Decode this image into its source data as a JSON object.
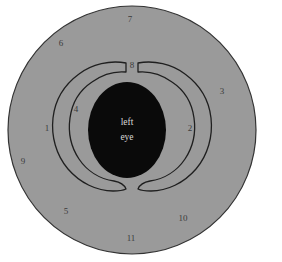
{
  "figure": {
    "kind": "anatomical-eye-cross-section-diagram",
    "center_label": {
      "line1": "left",
      "line2": "eye"
    },
    "colors": {
      "background": "#ffffff",
      "outer_disc_fill": "#9a9a9a",
      "outer_disc_stroke": "#333333",
      "band_fill": "#9a9a9a",
      "band_stroke": "#1f1f1f",
      "pupil_fill": "#0a0a0a",
      "label_text": "#3a3a3a",
      "center_text": "#d8d8d8"
    },
    "geometry": {
      "outer_disc": {
        "cx": 132,
        "cy": 130,
        "r": 124
      },
      "pupil": {
        "cx": 127,
        "cy": 130,
        "rx": 39,
        "ry": 48
      }
    },
    "labels": [
      {
        "id": "1",
        "text": "1",
        "x": 47,
        "y": 129
      },
      {
        "id": "2",
        "text": "2",
        "x": 190,
        "y": 129
      },
      {
        "id": "3",
        "text": "3",
        "x": 222,
        "y": 92
      },
      {
        "id": "4",
        "text": "4",
        "x": 76,
        "y": 110
      },
      {
        "id": "5",
        "text": "5",
        "x": 66,
        "y": 212
      },
      {
        "id": "6",
        "text": "6",
        "x": 61,
        "y": 44
      },
      {
        "id": "7",
        "text": "7",
        "x": 130,
        "y": 20
      },
      {
        "id": "8",
        "text": "8",
        "x": 132,
        "y": 66
      },
      {
        "id": "9",
        "text": "9",
        "x": 23,
        "y": 162
      },
      {
        "id": "10",
        "text": "10",
        "x": 183,
        "y": 219
      },
      {
        "id": "11",
        "text": "11",
        "x": 131,
        "y": 239
      }
    ]
  }
}
